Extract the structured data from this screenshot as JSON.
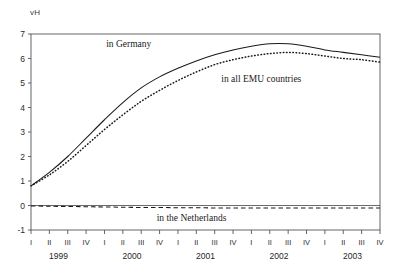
{
  "chart_data": {
    "type": "line",
    "title": "",
    "subtitle": "",
    "xlabel": "",
    "ylabel": "vH",
    "ylim": [
      -1,
      7
    ],
    "yticks": [
      -1,
      0,
      1,
      2,
      3,
      4,
      5,
      6,
      7
    ],
    "ytick_labels": [
      "-1",
      "0",
      "1",
      "2",
      "3",
      "4",
      "5",
      "6",
      "7"
    ],
    "grid": false,
    "legend_position": "inline-annotations",
    "x": [
      "1999 I",
      "1999 II",
      "1999 III",
      "1999 IV",
      "2000 I",
      "2000 II",
      "2000 III",
      "2000 IV",
      "2001 I",
      "2001 II",
      "2001 III",
      "2001 IV",
      "2002 I",
      "2002 II",
      "2002 III",
      "2002 IV",
      "2003 I",
      "2003 II",
      "2003 III",
      "2003 IV"
    ],
    "quarter_labels": [
      "I",
      "II",
      "III",
      "IV",
      "I",
      "II",
      "III",
      "IV",
      "I",
      "II",
      "III",
      "IV",
      "I",
      "II",
      "III",
      "IV",
      "I",
      "II",
      "III",
      "IV"
    ],
    "year_labels": [
      "1999",
      "2000",
      "2001",
      "2002",
      "2003"
    ],
    "series": [
      {
        "name": "in Germany",
        "style": "solid",
        "color": "#1a1a1a",
        "values": [
          0.8,
          1.35,
          2.0,
          2.75,
          3.5,
          4.2,
          4.8,
          5.25,
          5.6,
          5.9,
          6.15,
          6.35,
          6.5,
          6.6,
          6.6,
          6.5,
          6.35,
          6.25,
          6.15,
          6.05
        ]
      },
      {
        "name": "in all EMU countries",
        "style": "dotted",
        "color": "#1a1a1a",
        "values": [
          0.8,
          1.25,
          1.8,
          2.45,
          3.1,
          3.7,
          4.25,
          4.7,
          5.1,
          5.45,
          5.75,
          5.95,
          6.1,
          6.2,
          6.25,
          6.2,
          6.1,
          6.0,
          5.95,
          5.85
        ]
      },
      {
        "name": "in the Netherlands",
        "style": "dashed",
        "color": "#1a1a1a",
        "values": [
          -0.02,
          -0.03,
          -0.04,
          -0.05,
          -0.06,
          -0.07,
          -0.08,
          -0.08,
          -0.09,
          -0.09,
          -0.1,
          -0.1,
          -0.1,
          -0.1,
          -0.1,
          -0.1,
          -0.1,
          -0.1,
          -0.1,
          -0.1
        ]
      }
    ],
    "annotations": [
      {
        "text": "in Germany",
        "x_frac": 0.28,
        "y_value": 6.45
      },
      {
        "text": "in all EMU countries",
        "x_frac": 0.66,
        "y_value": 5.05
      },
      {
        "text": "in the Netherlands",
        "x_frac": 0.46,
        "y_value": -0.62
      }
    ],
    "zero_line": 0
  }
}
